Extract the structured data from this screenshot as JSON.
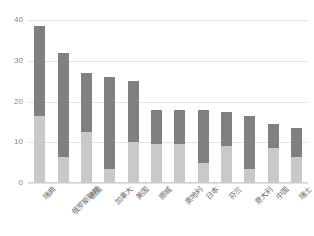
{
  "chart_data": {
    "type": "bar",
    "stacked": true,
    "title": "",
    "subtitle": "",
    "xlabel": "",
    "ylabel": "",
    "ylim": [
      0,
      40
    ],
    "yticks": [
      0,
      10,
      20,
      30,
      40
    ],
    "ytick_labels": [
      "0",
      "10",
      "20",
      "30",
      "40"
    ],
    "grid": true,
    "legend": "none",
    "orientation": "vertical",
    "categories": [
      "瑞典",
      "俄罗斯联邦",
      "德国",
      "加拿大",
      "美国",
      "挪威",
      "奥地利",
      "日本",
      "芬兰",
      "意大利",
      "中国",
      "瑞士"
    ],
    "series": [
      {
        "name": "下层",
        "color": "#c9c9c9",
        "values": [
          16.5,
          6.5,
          12.5,
          3.5,
          10.0,
          9.5,
          9.5,
          5.0,
          9.0,
          3.5,
          8.5,
          6.5
        ]
      },
      {
        "name": "上层",
        "color": "#808080",
        "values": [
          22.0,
          25.5,
          14.5,
          22.5,
          15.0,
          8.5,
          8.5,
          13.0,
          8.5,
          13.0,
          6.0,
          7.0
        ]
      }
    ],
    "totals": [
      38.5,
      32.0,
      27.0,
      26.0,
      25.0,
      18.0,
      18.0,
      18.0,
      17.5,
      16.5,
      14.5,
      13.5
    ]
  },
  "colors": {
    "segment_bottom": "#c9c9c9",
    "segment_top": "#808080",
    "gridline": "#e3e3e3",
    "axis_text": "#8a8a8a",
    "background": "#ffffff"
  }
}
